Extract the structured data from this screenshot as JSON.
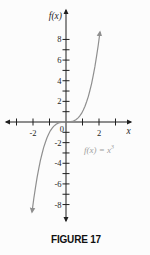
{
  "figure": {
    "caption": "FIGURE 17"
  },
  "colors": {
    "background": "#fcfcfc",
    "axis": "#1f1f1f",
    "curve": "#8f8f8f",
    "equation_text": "#9e9e9e",
    "caption": "#101010"
  },
  "chart_data": {
    "type": "line",
    "title": "",
    "xlabel": "x",
    "ylabel": "f(x)",
    "origin_label": "0",
    "equation_full": "f(x) = x^3",
    "equation_text": "f(x) = x",
    "equation_sup": "3",
    "xlim": [
      -3.6,
      3.9
    ],
    "ylim": [
      -10.8,
      10.8
    ],
    "grid": false,
    "legend": "none",
    "x_ticks": [
      -3,
      -2,
      -1,
      1,
      2,
      3
    ],
    "y_ticks": [
      -8,
      -7,
      -6,
      -5,
      -4,
      -3,
      -2,
      -1,
      1,
      2,
      3,
      4,
      5,
      6,
      7,
      8
    ],
    "x_labeled": [
      {
        "v": -2,
        "t": "-2"
      },
      {
        "v": 2,
        "t": "2"
      }
    ],
    "y_labeled": [
      {
        "v": 8,
        "t": "8"
      },
      {
        "v": 6,
        "t": "6"
      },
      {
        "v": 4,
        "t": "4"
      },
      {
        "v": 2,
        "t": "2"
      },
      {
        "v": -2,
        "t": "-2"
      },
      {
        "v": -4,
        "t": "-4"
      },
      {
        "v": -6,
        "t": "-6"
      },
      {
        "v": -8,
        "t": "-8"
      }
    ],
    "series": [
      {
        "name": "f(x) = x^3",
        "points": [
          [
            -2.06,
            -8.742
          ],
          [
            -1.95,
            -7.415
          ],
          [
            -1.85,
            -6.332
          ],
          [
            -1.75,
            -5.359
          ],
          [
            -1.65,
            -4.492
          ],
          [
            -1.55,
            -3.724
          ],
          [
            -1.45,
            -3.048
          ],
          [
            -1.35,
            -2.46
          ],
          [
            -1.25,
            -1.953
          ],
          [
            -1.15,
            -1.521
          ],
          [
            -1.05,
            -1.158
          ],
          [
            -0.95,
            -0.857
          ],
          [
            -0.85,
            -0.614
          ],
          [
            -0.75,
            -0.422
          ],
          [
            -0.6,
            -0.216
          ],
          [
            -0.45,
            -0.091
          ],
          [
            -0.3,
            -0.027
          ],
          [
            -0.15,
            -0.003
          ],
          [
            0,
            0
          ],
          [
            0.15,
            0.003
          ],
          [
            0.3,
            0.027
          ],
          [
            0.45,
            0.091
          ],
          [
            0.6,
            0.216
          ],
          [
            0.75,
            0.422
          ],
          [
            0.85,
            0.614
          ],
          [
            0.95,
            0.857
          ],
          [
            1.05,
            1.158
          ],
          [
            1.15,
            1.521
          ],
          [
            1.25,
            1.953
          ],
          [
            1.35,
            2.46
          ],
          [
            1.45,
            3.048
          ],
          [
            1.55,
            3.724
          ],
          [
            1.65,
            4.492
          ],
          [
            1.75,
            5.359
          ],
          [
            1.85,
            6.332
          ],
          [
            1.95,
            7.415
          ],
          [
            2.06,
            8.742
          ]
        ]
      }
    ]
  }
}
